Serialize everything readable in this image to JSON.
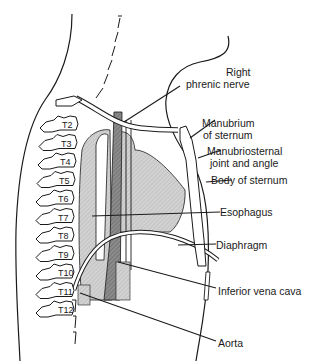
{
  "diagram": {
    "vertebrae": [
      "T2",
      "T3",
      "T4",
      "T5",
      "T6",
      "T7",
      "T8",
      "T9",
      "T10",
      "T11",
      "T12"
    ],
    "labels": {
      "right_phrenic_nerve": [
        "Right",
        "phrenic nerve"
      ],
      "manubrium": [
        "Manubrium",
        "of sternum"
      ],
      "manubriosternal": [
        "Manubriosternal",
        "joint and angle"
      ],
      "body_of_sternum": "Body of sternum",
      "esophagus": "Esophagus",
      "diaphragm": "Diaphragm",
      "inferior_vena_cava": "Inferior vena cava",
      "aorta": "Aorta"
    },
    "colors": {
      "line": "#1a1a1a",
      "organ_fill": "#c8c8c8",
      "esophagus_fill": "#8a8a8a",
      "background": "#ffffff"
    }
  }
}
